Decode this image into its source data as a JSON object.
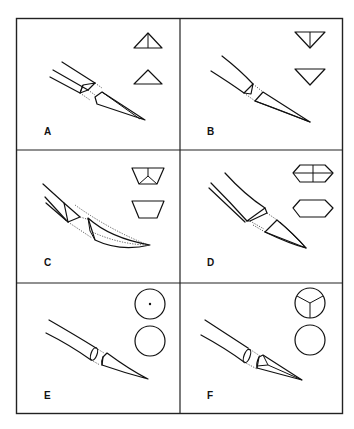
{
  "figure": {
    "type": "needle-tip-cross-section-diagram",
    "layout": {
      "rows": 3,
      "columns": 2
    },
    "line_color": "#111111",
    "background": "#ffffff",
    "panels": [
      {
        "label": "A",
        "tip": "triangular-cutting-curved",
        "section_top": "triangle-apex-up-with-center-line",
        "section_bottom": "triangle-apex-up"
      },
      {
        "label": "B",
        "tip": "reverse-cutting-curved",
        "section_top": "triangle-apex-down-with-center-line",
        "section_bottom": "triangle-apex-down"
      },
      {
        "label": "C",
        "tip": "spatula-curved",
        "section_top": "trapezoid-with-inner-v",
        "section_bottom": "trapezoid"
      },
      {
        "label": "D",
        "tip": "flattened-taper",
        "section_top": "rounded-hexagon-with-cross",
        "section_bottom": "rounded-hexagon"
      },
      {
        "label": "E",
        "tip": "round-taper",
        "section_top": "circle-with-center-dot",
        "section_bottom": "circle"
      },
      {
        "label": "F",
        "tip": "taper-cut",
        "section_top": "circle-with-tri-star",
        "section_bottom": "circle"
      }
    ]
  }
}
